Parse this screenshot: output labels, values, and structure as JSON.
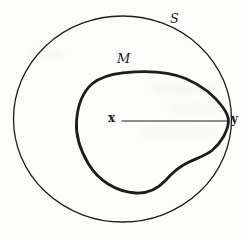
{
  "figure": {
    "labels": {
      "sphere": "S",
      "region": "M",
      "point_left": "x",
      "point_right": "y"
    },
    "colors": {
      "ink": "#1c1c1c",
      "paper": "#fcfcfa"
    }
  }
}
